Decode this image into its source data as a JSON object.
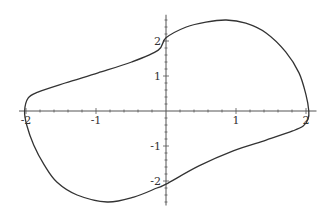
{
  "chart_data": {
    "type": "line",
    "title": "",
    "xlabel": "",
    "ylabel": "",
    "xlim": [
      -2.1,
      2.15
    ],
    "ylim": [
      -2.7,
      2.75
    ],
    "grid": false,
    "legend": null,
    "x_ticks": [
      -2,
      -1,
      1,
      2
    ],
    "y_ticks": [
      -2,
      -1,
      1,
      2
    ],
    "x_tick_labels": [
      "-2",
      "-1",
      "1",
      "2"
    ],
    "y_tick_labels": [
      "-2",
      "-1",
      "1",
      "2"
    ],
    "series": [
      {
        "name": "limit cycle",
        "color": "#333333",
        "points": [
          [
            -2.02,
            0.0
          ],
          [
            -1.97,
            0.37
          ],
          [
            -1.83,
            0.54
          ],
          [
            -1.44,
            0.8
          ],
          [
            -0.97,
            1.09
          ],
          [
            -0.49,
            1.4
          ],
          [
            -0.11,
            1.74
          ],
          [
            0.0,
            2.09
          ],
          [
            0.29,
            2.4
          ],
          [
            0.57,
            2.54
          ],
          [
            0.86,
            2.6
          ],
          [
            1.14,
            2.51
          ],
          [
            1.43,
            2.23
          ],
          [
            1.71,
            1.69
          ],
          [
            1.9,
            1.09
          ],
          [
            2.0,
            0.46
          ],
          [
            2.04,
            0.0
          ],
          [
            2.03,
            -0.23
          ],
          [
            1.96,
            -0.43
          ],
          [
            1.81,
            -0.57
          ],
          [
            1.43,
            -0.83
          ],
          [
            0.96,
            -1.14
          ],
          [
            0.47,
            -1.57
          ],
          [
            0.0,
            -2.09
          ],
          [
            -0.13,
            -2.2
          ],
          [
            -0.46,
            -2.46
          ],
          [
            -0.84,
            -2.6
          ],
          [
            -1.27,
            -2.4
          ],
          [
            -1.56,
            -2.03
          ],
          [
            -1.74,
            -1.54
          ],
          [
            -1.89,
            -0.97
          ],
          [
            -1.99,
            -0.4
          ],
          [
            -2.02,
            0.0
          ]
        ]
      }
    ]
  }
}
